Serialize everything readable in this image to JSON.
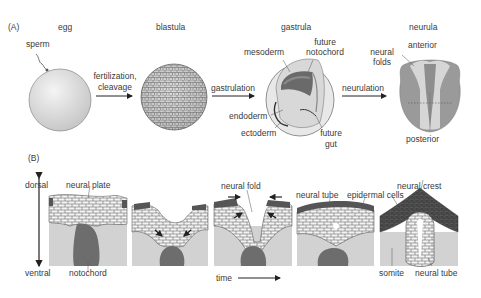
{
  "panel_a": {
    "label": "(A)",
    "stages": {
      "egg": "egg",
      "blastula": "blastula",
      "gastrula": "gastrula",
      "neurula": "neurula"
    },
    "labels": {
      "sperm": "sperm",
      "fertilization_1": "fertilization,",
      "fertilization_2": "cleavage",
      "gastrulation": "gastrulation",
      "neurulation": "neurulation",
      "mesoderm": "mesoderm",
      "future_notochord_1": "future",
      "future_notochord_2": "notochord",
      "endoderm": "endoderm",
      "ectoderm": "ectoderm",
      "future_gut_1": "future",
      "future_gut_2": "gut",
      "neural_folds_1": "neural",
      "neural_folds_2": "folds",
      "anterior": "anterior",
      "posterior": "posterior"
    }
  },
  "panel_b": {
    "label": "(B)",
    "axis": {
      "dorsal": "dorsal",
      "ventral": "ventral"
    },
    "time": "time",
    "labels": {
      "neural_plate": "neural plate",
      "notochord": "notochord",
      "neural_fold": "neural fold",
      "neural_tube_top": "neural tube",
      "epidermal_cells": "epidermal cells",
      "neural_crest": "neural crest",
      "somite": "somite",
      "neural_tube_bottom": "neural tube"
    }
  },
  "colors": {
    "light_gray": "#d4d4d4",
    "mid_gray": "#9a9a9a",
    "dark_gray": "#5c5c5c",
    "cell_fill": "#f2f2f2",
    "line": "#333333"
  }
}
